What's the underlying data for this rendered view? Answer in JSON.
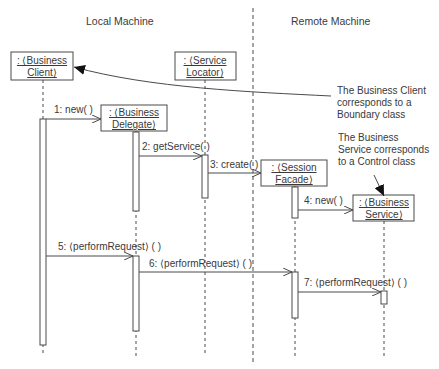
{
  "diagram": {
    "type": "UML sequence diagram",
    "regions": {
      "local": {
        "label": "Local Machine"
      },
      "remote": {
        "label": "Remote Machine"
      }
    },
    "objects": [
      {
        "id": "client",
        "line1": ": ⟨Business",
        "line2": "Client⟩"
      },
      {
        "id": "delegate",
        "line1": ": ⟨Business",
        "line2": "Delegate⟩"
      },
      {
        "id": "locator",
        "line1": ": ⟨Service",
        "line2": "Locator⟩"
      },
      {
        "id": "facade",
        "line1": ": ⟨Session",
        "line2": "Facade⟩"
      },
      {
        "id": "service",
        "line1": ": ⟨Business",
        "line2": "Service⟩"
      }
    ],
    "messages": [
      {
        "n": 1,
        "label": "1: new( )"
      },
      {
        "n": 2,
        "label": "2: getService( )"
      },
      {
        "n": 3,
        "label": "3: create( )"
      },
      {
        "n": 4,
        "label": "4: new( )"
      },
      {
        "n": 5,
        "label": "5: ⟨performRequest⟩ ( )"
      },
      {
        "n": 6,
        "label": "6: ⟨performRequest⟩ ( )"
      },
      {
        "n": 7,
        "label": "7: ⟨performRequest⟩ ( )"
      }
    ],
    "notes": [
      {
        "id": "boundary-note",
        "lines": [
          "The Business Client",
          "corresponds to a",
          "Boundary class"
        ]
      },
      {
        "id": "control-note",
        "lines": [
          "The Business",
          "Service corresponds",
          "to a Control class"
        ]
      }
    ],
    "colors": {
      "line": "#4a4a4a",
      "text": "#3a3a3a",
      "background": "#ffffff"
    }
  }
}
